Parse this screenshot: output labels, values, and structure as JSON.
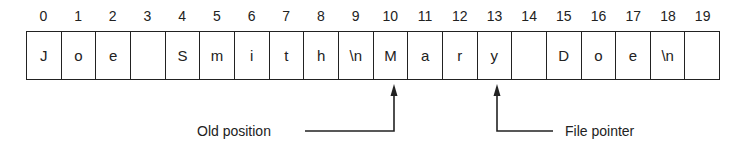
{
  "diagram": {
    "indices": [
      "0",
      "1",
      "2",
      "3",
      "4",
      "5",
      "6",
      "7",
      "8",
      "9",
      "10",
      "11",
      "12",
      "13",
      "14",
      "15",
      "16",
      "17",
      "18",
      "19"
    ],
    "cells": [
      "J",
      "o",
      "e",
      "",
      "S",
      "m",
      "i",
      "t",
      "h",
      "\\n",
      "M",
      "a",
      "r",
      "y",
      "",
      "D",
      "o",
      "e",
      "\\n",
      ""
    ],
    "old_position_label": "Old position",
    "file_pointer_label": "File pointer",
    "old_position_index": 10,
    "file_pointer_index": 13,
    "line_color": "#222222"
  }
}
